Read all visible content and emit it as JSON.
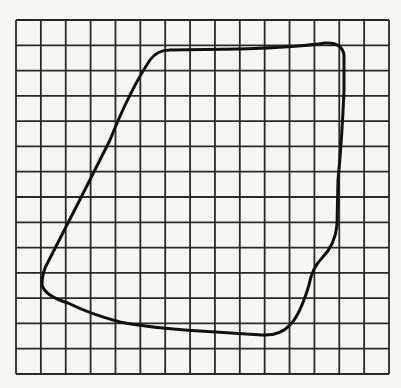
{
  "figure": {
    "background_color": "#f6f6f4",
    "grid": {
      "left": 16,
      "top": 20,
      "right": 389,
      "bottom": 374,
      "columns": 15,
      "rows": 14,
      "line_color": "#2a2a2a",
      "line_width": 1.8
    },
    "shape": {
      "stroke_color": "#111111",
      "stroke_width": 3,
      "path": "M 150 60 Q 157 50 170 50 L 240 49 Q 300 47 325 43 Q 342 42 344 55 L 344 90 Q 342 140 338 180 L 337 225 Q 335 245 322 258 Q 312 268 309 285 Q 300 315 290 325 Q 280 336 262 335 L 200 331 Q 150 328 120 322 Q 90 314 68 303 Q 45 296 42 285 Q 42 272 48 262 Q 80 200 110 140 Q 130 90 150 60 Z"
    }
  }
}
